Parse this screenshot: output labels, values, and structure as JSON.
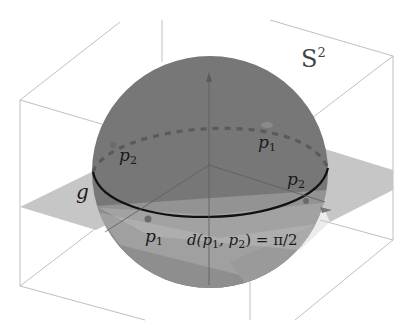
{
  "figure": {
    "title": "S",
    "title_superscript": "2",
    "labels": {
      "geodesic": "g",
      "p1_back": "p",
      "p1_back_sub": "1",
      "p2_back": "p",
      "p2_back_sub": "2",
      "p1_front": "p",
      "p1_front_sub": "1",
      "p2_front": "p",
      "p2_front_sub": "2",
      "distance_prefix": "d(p",
      "distance_sub1": "1",
      "distance_mid": ", p",
      "distance_sub2": "2",
      "distance_suffix": ") = π/2"
    },
    "colors": {
      "sphere": "#7a7a7a",
      "sphere_lower": "#8c8c8c",
      "plane": "#c4c4c4",
      "box_edges": "#b0b0b0",
      "equator": "#111111",
      "dashed_equator": "#5a5a5a",
      "background": "#ffffff"
    }
  }
}
